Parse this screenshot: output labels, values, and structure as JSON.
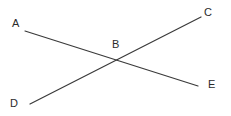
{
  "figure": {
    "background_color": "#ffffff",
    "stroke_color": "#3a3a3a",
    "text_color": "#2b2b2b",
    "stroke_width": 1.2,
    "width": 231,
    "height": 116,
    "points": {
      "A": {
        "label": "A",
        "x": 25,
        "y": 31
      },
      "B": {
        "label": "B",
        "x": 119,
        "y": 61
      },
      "C": {
        "label": "C",
        "x": 201,
        "y": 17
      },
      "D": {
        "label": "D",
        "x": 30,
        "y": 104
      },
      "E": {
        "label": "E",
        "x": 198,
        "y": 86
      }
    },
    "segments": [
      {
        "name": "segment-AE",
        "from": "A",
        "to": "E",
        "x1": 25,
        "y1": 31,
        "x2": 198,
        "y2": 86
      },
      {
        "name": "segment-DC",
        "from": "D",
        "to": "C",
        "x1": 30,
        "y1": 104,
        "x2": 201,
        "y2": 17
      }
    ]
  }
}
